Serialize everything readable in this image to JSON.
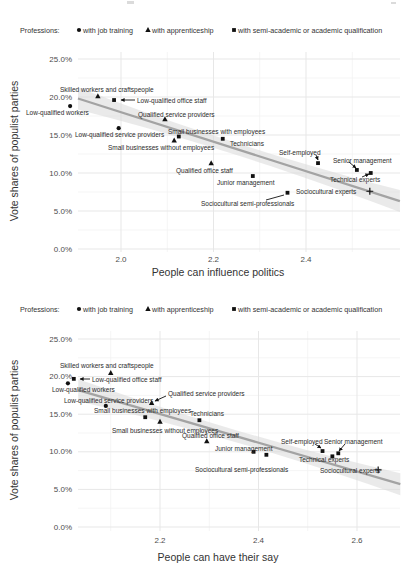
{
  "legend": {
    "title": "Professions:",
    "items": [
      {
        "marker": "circle",
        "label": "with job training"
      },
      {
        "marker": "triangle",
        "label": "with apprenticeship"
      },
      {
        "marker": "square",
        "label": "with semi-academic or academic qualification"
      }
    ]
  },
  "colors": {
    "marker": "#111111",
    "trend_line": "#a3a3a3",
    "trend_band": "#dcdcdc",
    "grid_major": "#e7e7e7",
    "grid_minor": "#f3f3f3",
    "tick_text": "#4d4d4d",
    "label_text": "#2b2b2b"
  },
  "chart_data": [
    {
      "type": "scatter",
      "xlabel": "People can influence politics",
      "ylabel": "Vote shares of populist parties",
      "x_tick_values": [
        2.0,
        2.2,
        2.4
      ],
      "x_tick_labels": [
        "2.0",
        "2.2",
        "2.4"
      ],
      "y_tick_values": [
        0,
        5,
        10,
        15,
        20,
        25
      ],
      "y_tick_labels": [
        "0.0%",
        "5.0%",
        "10.0%",
        "15.0%",
        "20.0%",
        "25.0%"
      ],
      "xlim": [
        1.907,
        2.603
      ],
      "ylim": [
        0,
        26
      ],
      "grid": "major+minor",
      "legend_position": "top",
      "trend": {
        "type": "linear_fit_with_ci_band",
        "x1": 1.907,
        "y1": 19.8,
        "x2": 2.603,
        "y2": 6.3
      },
      "points": [
        {
          "label": "Skilled workers and craftspeople",
          "group": "with apprenticeship",
          "marker": "triangle",
          "x": 1.95,
          "y": 20.1,
          "lx": 60,
          "ly": 85.5
        },
        {
          "label": "Low-qualified office staff",
          "group": "with semi-academic or academic qualification",
          "marker": "square",
          "x": 1.985,
          "y": 19.6,
          "lx": 137,
          "ly": 96.5,
          "leader": [
            135,
            100,
            121,
            100
          ],
          "ah": true
        },
        {
          "label": "Low-qualified workers",
          "group": "with job training",
          "marker": "circle",
          "x": 1.89,
          "y": 18.8,
          "lx": 26,
          "ly": 108.5
        },
        {
          "label": "Qualified service providers",
          "group": "with apprenticeship",
          "marker": "triangle",
          "x": 2.095,
          "y": 17.1,
          "lx": 138,
          "ly": 111
        },
        {
          "label": "Low-qualified service providers",
          "group": "with job training",
          "marker": "circle",
          "x": 1.995,
          "y": 15.9,
          "lx": 75,
          "ly": 130.5
        },
        {
          "label": "Small businesses with employees",
          "group": "with semi-academic or academic qualification",
          "marker": "square",
          "x": 2.125,
          "y": 14.8,
          "lx": 168,
          "ly": 127.5
        },
        {
          "label": "Small businesses without employees",
          "group": "with apprenticeship",
          "marker": "triangle",
          "x": 2.115,
          "y": 14.3,
          "lx": 108,
          "ly": 143.5
        },
        {
          "label": "Technicians",
          "group": "with semi-academic or academic qualification",
          "marker": "square",
          "x": 2.22,
          "y": 14.5,
          "lx": 230,
          "ly": 139.5
        },
        {
          "label": "Qualified office staff",
          "group": "with apprenticeship",
          "marker": "triangle",
          "x": 2.195,
          "y": 11.3,
          "lx": 176,
          "ly": 166.5
        },
        {
          "label": "Junior management",
          "group": "with semi-academic or academic qualification",
          "marker": "square",
          "x": 2.285,
          "y": 9.6,
          "lx": 217,
          "ly": 179
        },
        {
          "label": "Self-employed",
          "group": "with semi-academic or academic qualification",
          "marker": "square",
          "x": 2.426,
          "y": 11.3,
          "lx": 279,
          "ly": 149,
          "leader": [
            316,
            155,
            318,
            160
          ],
          "ah": true
        },
        {
          "label": "Senior management",
          "group": "with semi-academic or academic qualification",
          "marker": "square",
          "x": 2.51,
          "y": 10.4,
          "lx": 333,
          "ly": 156.5,
          "leader": [
            349,
            162,
            356,
            168
          ],
          "ah": true
        },
        {
          "label": "Technical experts",
          "group": "with semi-academic or academic qualification",
          "marker": "square",
          "x": 2.54,
          "y": 10.0,
          "lx": 330,
          "ly": 175.5,
          "leader": [
            362,
            177,
            369,
            174
          ],
          "ah": true
        },
        {
          "label": "Sociocultural experts",
          "group": "with semi-academic or academic qualification",
          "marker": "plus",
          "x": 2.538,
          "y": 7.6,
          "lx": 296,
          "ly": 187.5
        },
        {
          "label": "Sociocultural semi-professionals",
          "group": "with semi-academic or academic qualification",
          "marker": "square",
          "x": 2.36,
          "y": 7.4,
          "lx": 201,
          "ly": 200,
          "leader": [
            284,
            195,
            266,
            200
          ],
          "ah": false
        }
      ]
    },
    {
      "type": "scatter",
      "xlabel": "People can have their say",
      "ylabel": "Vote shares of populist parties",
      "x_tick_values": [
        2.2,
        2.4,
        2.6
      ],
      "x_tick_labels": [
        "2.2",
        "2.4",
        "2.6"
      ],
      "y_tick_values": [
        0,
        5,
        10,
        15,
        20,
        25
      ],
      "y_tick_labels": [
        "0.0%",
        "5.0%",
        "10.0%",
        "15.0%",
        "20.0%",
        "25.0%"
      ],
      "xlim": [
        2.034,
        2.688
      ],
      "ylim": [
        0,
        26
      ],
      "grid": "major+minor",
      "legend_position": "top",
      "trend": {
        "type": "linear_fit_with_ci_band",
        "x1": 2.034,
        "y1": 18.2,
        "x2": 2.688,
        "y2": 5.7
      },
      "points": [
        {
          "label": "Skilled workers and craftspeople",
          "group": "with apprenticeship",
          "marker": "triangle",
          "x": 2.1,
          "y": 20.5,
          "lx": 60,
          "ly": 362
        },
        {
          "label": "Low-qualified office staff",
          "group": "with semi-academic or academic qualification",
          "marker": "square",
          "x": 2.025,
          "y": 19.7,
          "lx": 92,
          "ly": 375.5,
          "leader": [
            90,
            379,
            80,
            379
          ],
          "ah": true
        },
        {
          "label": "Low-qualified workers",
          "group": "with job training",
          "marker": "circle",
          "x": 2.013,
          "y": 19.1,
          "lx": 52,
          "ly": 385.5
        },
        {
          "label": "Low-qualified service providers",
          "group": "with job training",
          "marker": "circle",
          "x": 2.09,
          "y": 16.1,
          "lx": 64,
          "ly": 396.5
        },
        {
          "label": "Qualified service providers",
          "group": "with apprenticeship",
          "marker": "triangle",
          "x": 2.183,
          "y": 16.5,
          "lx": 168,
          "ly": 390,
          "leader": [
            166,
            396,
            155,
            401
          ],
          "ah": true
        },
        {
          "label": "Small businesses with employees",
          "group": "with semi-academic or academic qualification",
          "marker": "square",
          "x": 2.17,
          "y": 14.6,
          "lx": 94,
          "ly": 407
        },
        {
          "label": "Small businesses without employees",
          "group": "with apprenticeship",
          "marker": "triangle",
          "x": 2.2,
          "y": 14.0,
          "lx": 112,
          "ly": 426.5
        },
        {
          "label": "Technicians",
          "group": "with semi-academic or academic qualification",
          "marker": "square",
          "x": 2.28,
          "y": 14.2,
          "lx": 190,
          "ly": 410
        },
        {
          "label": "Qualified office staff",
          "group": "with apprenticeship",
          "marker": "triangle",
          "x": 2.295,
          "y": 11.4,
          "lx": 182,
          "ly": 431.5
        },
        {
          "label": "Junior management",
          "group": "with semi-academic or academic qualification",
          "marker": "square",
          "x": 2.39,
          "y": 10.0,
          "lx": 215,
          "ly": 444.5
        },
        {
          "label": "Self-employed",
          "group": "with semi-academic or academic qualification",
          "marker": "square",
          "x": 2.53,
          "y": 10.1,
          "lx": 281,
          "ly": 437.5,
          "leader": [
            315,
            444,
            321,
            448
          ],
          "ah": true
        },
        {
          "label": "Senior management",
          "group": "with semi-academic or academic qualification",
          "marker": "square",
          "x": 2.562,
          "y": 9.8,
          "lx": 324,
          "ly": 437.5,
          "leader": [
            345,
            444,
            339,
            451
          ],
          "ah": true
        },
        {
          "label": "Technical experts",
          "group": "with semi-academic or academic qualification",
          "marker": "square",
          "x": 2.55,
          "y": 9.4,
          "lx": 299,
          "ly": 455.5
        },
        {
          "label": "Sociocultural experts",
          "group": "with semi-academic or academic qualification",
          "marker": "plus",
          "x": 2.643,
          "y": 7.6,
          "lx": 320,
          "ly": 466.5
        },
        {
          "label": "Sociocultural semi-professionals",
          "group": "with semi-academic or academic qualification",
          "marker": "square",
          "x": 2.416,
          "y": 9.6,
          "lx": 195,
          "ly": 465.5
        }
      ]
    }
  ]
}
